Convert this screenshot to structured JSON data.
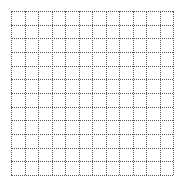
{
  "grid": {
    "columns": 12,
    "rows": 12,
    "line_style": "dotted",
    "line_color": "#555555",
    "background_color": "#ffffff"
  }
}
